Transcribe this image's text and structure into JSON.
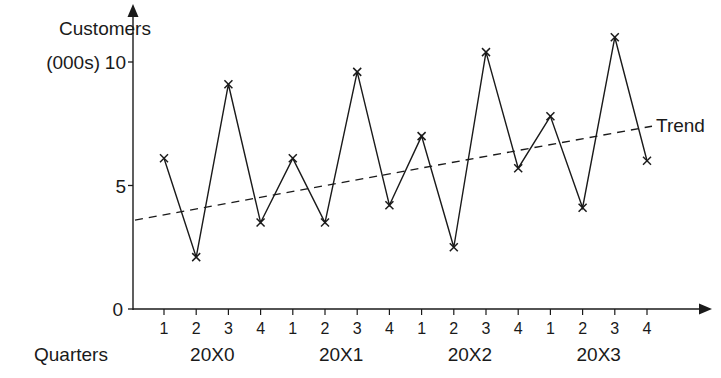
{
  "chart_data": {
    "type": "line",
    "title": "",
    "ylabel_line1": "Customers",
    "ylabel_line2": "(000s)",
    "xlabel": "Quarters",
    "ylim": [
      0,
      11.5
    ],
    "yticks": [
      0,
      5,
      10
    ],
    "ytick_labels": [
      "0",
      "5",
      "10"
    ],
    "grid": false,
    "legend": "none",
    "years": [
      "20X0",
      "20X1",
      "20X2",
      "20X3"
    ],
    "categories": [
      "1",
      "2",
      "3",
      "4",
      "1",
      "2",
      "3",
      "4",
      "1",
      "2",
      "3",
      "4",
      "1",
      "2",
      "3",
      "4"
    ],
    "series": [
      {
        "name": "Customers",
        "style": "solid line with x markers",
        "values": [
          6.1,
          2.1,
          9.1,
          3.5,
          6.1,
          3.5,
          9.6,
          4.2,
          7.0,
          2.5,
          10.4,
          5.7,
          7.8,
          4.1,
          11.0,
          6.0
        ]
      },
      {
        "name": "Trend",
        "style": "dashed line",
        "start_value": 3.6,
        "end_value": 7.4
      }
    ],
    "annotations": [
      {
        "text": "Trend",
        "position": "end of dashed trend line, right side"
      }
    ]
  }
}
